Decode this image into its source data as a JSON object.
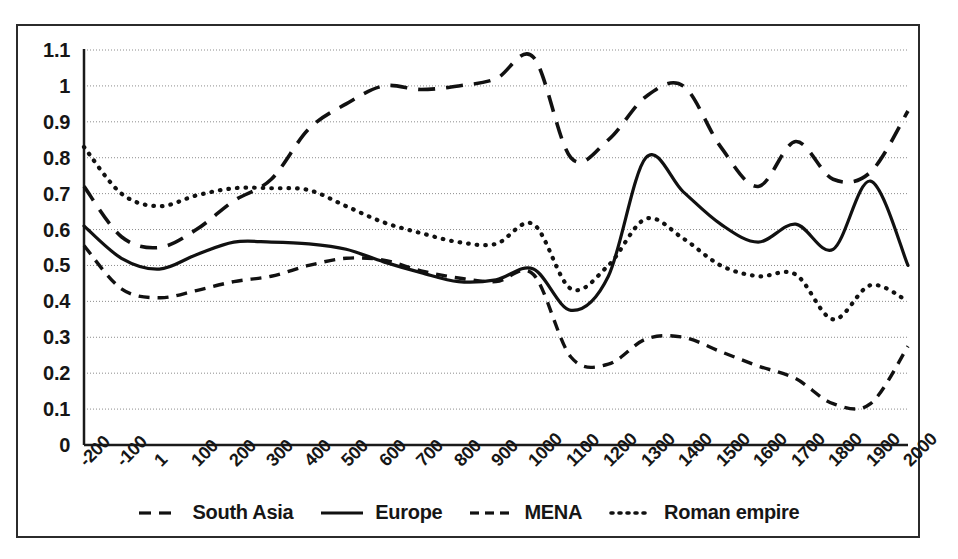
{
  "chart_data": {
    "type": "line",
    "title": "",
    "subtitle": "",
    "xlabel": "",
    "ylabel": "",
    "xlim": [
      -200,
      2000
    ],
    "ylim": [
      0,
      1.1
    ],
    "grid": true,
    "grid_axis": "y",
    "legend_position": "bottom",
    "x_tick_labels": [
      "-200",
      "-100",
      "1",
      "100",
      "200",
      "300",
      "400",
      "500",
      "600",
      "700",
      "800",
      "900",
      "1000",
      "1100",
      "1200",
      "1300",
      "1400",
      "1500",
      "1600",
      "1700",
      "1800",
      "1900",
      "2000"
    ],
    "y_tick_labels": [
      "0",
      "0.1",
      "0.2",
      "0.3",
      "0.4",
      "0.5",
      "0.6",
      "0.7",
      "0.8",
      "0.9",
      "1",
      "1.1"
    ],
    "y_tick_values": [
      0,
      0.1,
      0.2,
      0.3,
      0.4,
      0.5,
      0.6,
      0.7,
      0.8,
      0.9,
      1.0,
      1.1
    ],
    "x": [
      -200,
      -100,
      1,
      100,
      200,
      300,
      400,
      500,
      600,
      700,
      800,
      900,
      1000,
      1100,
      1200,
      1300,
      1400,
      1500,
      1600,
      1700,
      1800,
      1900,
      2000
    ],
    "series": [
      {
        "name": "South Asia",
        "style": "long-dash",
        "color": "#111111",
        "values": [
          0.72,
          0.58,
          0.55,
          0.6,
          0.68,
          0.74,
          0.88,
          0.95,
          1.0,
          0.99,
          1.0,
          1.02,
          1.08,
          0.8,
          0.85,
          0.97,
          1.0,
          0.83,
          0.72,
          0.845,
          0.74,
          0.76,
          0.93
        ]
      },
      {
        "name": "Europe",
        "style": "solid",
        "color": "#111111",
        "values": [
          0.61,
          0.52,
          0.49,
          0.53,
          0.565,
          0.565,
          0.56,
          0.545,
          0.51,
          0.48,
          0.455,
          0.46,
          0.49,
          0.375,
          0.47,
          0.8,
          0.705,
          0.615,
          0.565,
          0.615,
          0.545,
          0.735,
          0.5
        ]
      },
      {
        "name": "MENA",
        "style": "short-dash",
        "color": "#111111",
        "values": [
          0.555,
          0.435,
          0.41,
          0.43,
          0.455,
          0.47,
          0.5,
          0.52,
          0.515,
          0.485,
          0.465,
          0.455,
          0.475,
          0.245,
          0.225,
          0.295,
          0.3,
          0.26,
          0.22,
          0.185,
          0.115,
          0.115,
          0.275
        ]
      },
      {
        "name": "Roman empire",
        "style": "dotted",
        "color": "#111111",
        "values": [
          0.83,
          0.7,
          0.665,
          0.695,
          0.715,
          0.715,
          0.71,
          0.665,
          0.62,
          0.59,
          0.565,
          0.56,
          0.615,
          0.435,
          0.5,
          0.63,
          0.575,
          0.5,
          0.47,
          0.475,
          0.35,
          0.445,
          0.4
        ]
      }
    ]
  },
  "legend": {
    "items": [
      {
        "label": "South Asia",
        "style": "long-dash"
      },
      {
        "label": "Europe",
        "style": "solid"
      },
      {
        "label": "MENA",
        "style": "short-dash"
      },
      {
        "label": "Roman empire",
        "style": "dotted"
      }
    ]
  }
}
